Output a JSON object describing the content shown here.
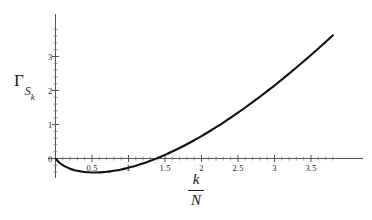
{
  "figure": {
    "background_color": "#ffffff",
    "curve_color": "#111111",
    "axis_color": "#555555"
  },
  "axes": {
    "y_axis_label_main": "Γ",
    "y_axis_label_sub": "S",
    "y_axis_label_subsub": "k",
    "x_axis_label_numerator": "k",
    "x_axis_label_denominator": "N",
    "x_tick_labels": [
      "0.5",
      "1",
      "1.5",
      "2",
      "2.5",
      "3",
      "3.5"
    ],
    "x_tick_values": [
      0.5,
      1,
      1.5,
      2,
      2.5,
      3,
      3.5
    ],
    "y_tick_labels": [
      "0",
      "1",
      "2",
      "3"
    ],
    "y_tick_values": [
      0,
      1,
      2,
      3
    ]
  },
  "chart_data": {
    "type": "line",
    "title": "",
    "subtitle": "",
    "xlabel": "k/N",
    "ylabel": "Γ_{S_k}",
    "xlim": [
      0,
      3.82
    ],
    "ylim": [
      -0.55,
      3.85
    ],
    "grid": false,
    "legend": null,
    "minor_ticks": true,
    "series": [
      {
        "name": "Γ_{S_k}",
        "color": "#111111",
        "line_width": 2.1,
        "x": [
          0.0,
          0.05,
          0.1,
          0.15,
          0.2,
          0.25,
          0.3,
          0.35,
          0.4,
          0.45,
          0.5,
          0.55,
          0.6,
          0.65,
          0.7,
          0.75,
          0.8,
          0.85,
          0.9,
          0.95,
          1.0,
          1.05,
          1.1,
          1.15,
          1.2,
          1.25,
          1.3,
          1.35,
          1.4,
          1.45,
          1.5,
          1.6,
          1.7,
          1.8,
          1.9,
          2.0,
          2.1,
          2.2,
          2.3,
          2.4,
          2.5,
          2.6,
          2.7,
          2.8,
          2.9,
          3.0,
          3.1,
          3.2,
          3.3,
          3.4,
          3.5,
          3.6,
          3.7,
          3.8
        ],
        "y": [
          0.0,
          -0.118,
          -0.196,
          -0.255,
          -0.3,
          -0.335,
          -0.362,
          -0.382,
          -0.396,
          -0.405,
          -0.41,
          -0.411,
          -0.408,
          -0.401,
          -0.391,
          -0.378,
          -0.362,
          -0.343,
          -0.322,
          -0.298,
          -0.272,
          -0.243,
          -0.212,
          -0.179,
          -0.144,
          -0.107,
          -0.068,
          -0.027,
          0.016,
          0.061,
          0.107,
          0.205,
          0.309,
          0.42,
          0.537,
          0.659,
          0.787,
          0.92,
          1.058,
          1.201,
          1.348,
          1.5,
          1.656,
          1.816,
          1.98,
          2.148,
          2.32,
          2.496,
          2.675,
          2.858,
          3.044,
          3.234,
          3.427,
          3.624
        ]
      }
    ],
    "annotations": {
      "minimum_approx": {
        "x": 0.55,
        "y": -0.41
      },
      "zero_crossing_approx": {
        "x": 1.37,
        "y": 0.0
      },
      "origin_value": {
        "x": 0.0,
        "y": 0.0
      }
    }
  }
}
